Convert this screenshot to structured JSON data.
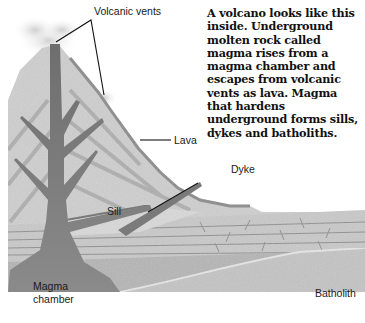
{
  "caption": {
    "text": "A volcano looks like this inside. Underground molten rock called magma rises from a magma chamber and escapes from volcanic vents as lava. Magma that hardens underground forms sills, dykes and batholiths."
  },
  "labels": {
    "volcanic_vents": "Volcanic vents",
    "lava": "Lava",
    "dyke": "Dyke",
    "sill": "Sill",
    "magma_line1": "Magma",
    "magma_line2": "chamber",
    "batholith": "Batholith"
  },
  "colors": {
    "background": "#ffffff",
    "rock_light": "#d6d6d6",
    "rock_mid": "#bdbdbd",
    "magma": "#7a7a7a",
    "magma_dark": "#5e5e5e",
    "strata": "#a8a8a8",
    "leader_line": "#111111"
  }
}
